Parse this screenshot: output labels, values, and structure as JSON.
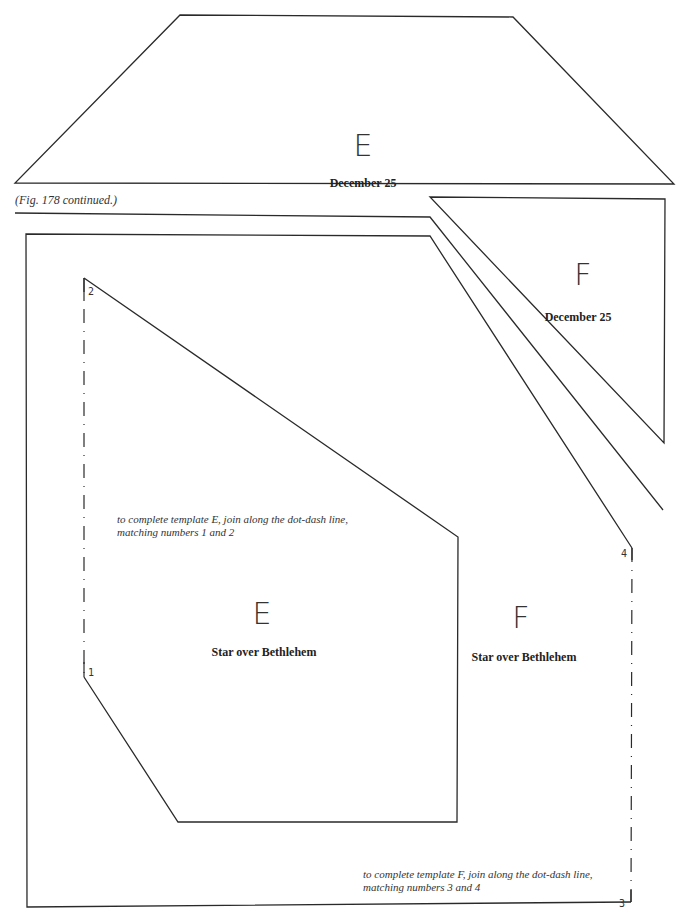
{
  "figure": {
    "caption": "(Fig. 178 continued.)"
  },
  "templates": [
    {
      "id": "E-top",
      "letter": "E",
      "label": "December 25",
      "shape": "trapezoid"
    },
    {
      "id": "F-top",
      "letter": "F",
      "label": "December 25",
      "shape": "triangle"
    },
    {
      "id": "E-bottom",
      "letter": "E",
      "label": "Star over Bethlehem",
      "instruction": "to complete template E, join along the dot-dash line, matching numbers 1 and 2",
      "join_numbers": [
        "1",
        "2"
      ]
    },
    {
      "id": "F-bottom",
      "letter": "F",
      "label": "Star over Bethlehem",
      "instruction": "to complete template F, join along the dot-dash line, matching numbers 3 and 4",
      "join_numbers": [
        "3",
        "4"
      ]
    }
  ],
  "colors": {
    "line": "#2a2a2a",
    "background": "#ffffff"
  }
}
